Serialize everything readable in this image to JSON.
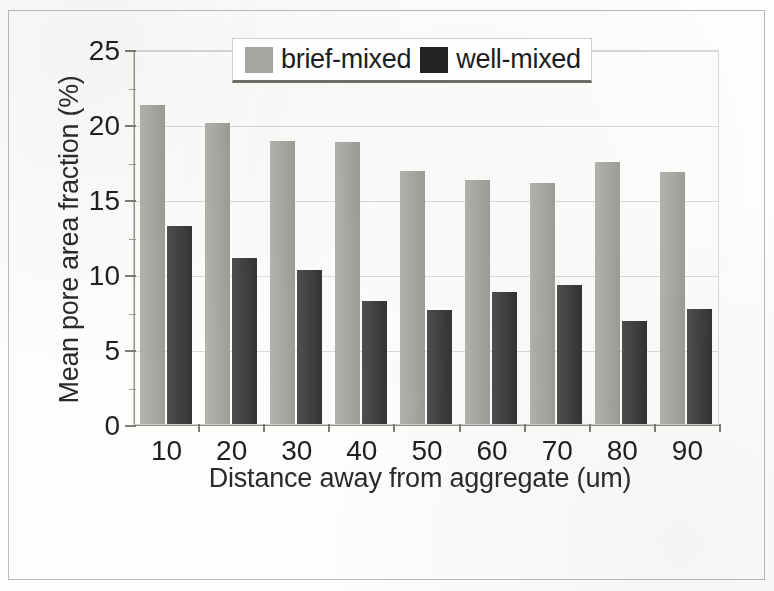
{
  "figure": {
    "frame_color": "#b9b9b5",
    "background": "#fdfdfb"
  },
  "legend": {
    "position": "top-center",
    "items": [
      {
        "label": "brief-mixed",
        "swatch": "legend-swatch-gray",
        "color": "#a5a5a1"
      },
      {
        "label": "well-mixed",
        "swatch": "legend-swatch-black",
        "color": "#232322"
      }
    ]
  },
  "axes": {
    "y": {
      "title": "Mean pore area fraction (%)",
      "ticks": [
        "0",
        "5",
        "10",
        "15",
        "20",
        "25"
      ],
      "min": 0,
      "max": 25
    },
    "x": {
      "title": "Distance away from aggregate (um)",
      "ticks": [
        "10",
        "20",
        "30",
        "40",
        "50",
        "60",
        "70",
        "80",
        "90"
      ]
    }
  },
  "chart_data": {
    "type": "bar",
    "title": "",
    "xlabel": "Distance away from aggregate (um)",
    "ylabel": "Mean pore area fraction (%)",
    "ylim": [
      0,
      25
    ],
    "yticks": [
      0,
      5,
      10,
      15,
      20,
      25
    ],
    "grid": true,
    "legend_position": "top-center",
    "categories": [
      "10",
      "20",
      "30",
      "40",
      "50",
      "60",
      "70",
      "80",
      "90"
    ],
    "series": [
      {
        "name": "brief-mixed",
        "color": "#a5a5a1",
        "values": [
          21.3,
          20.1,
          18.9,
          18.8,
          16.9,
          16.3,
          16.1,
          17.5,
          16.8
        ]
      },
      {
        "name": "well-mixed",
        "color": "#3b3b3a",
        "values": [
          13.2,
          11.1,
          10.3,
          8.2,
          7.6,
          8.8,
          9.3,
          6.9,
          7.7
        ]
      }
    ]
  }
}
